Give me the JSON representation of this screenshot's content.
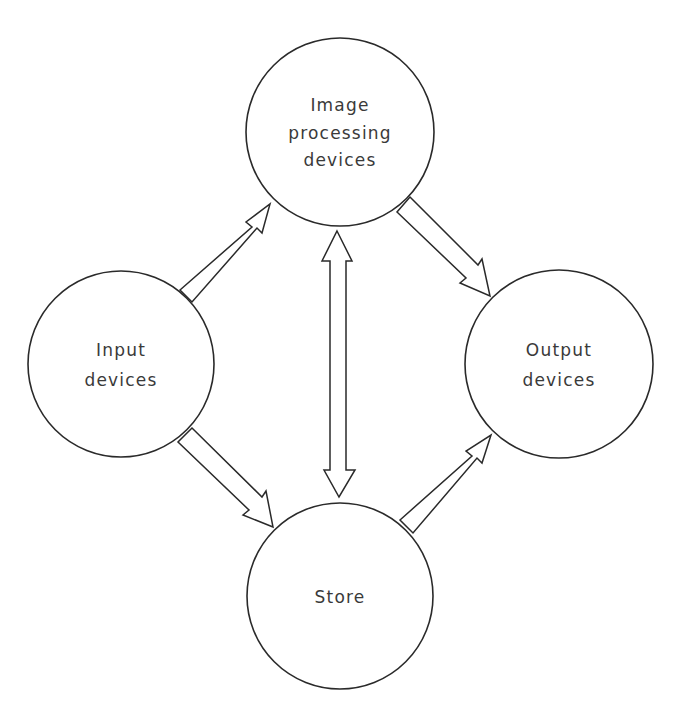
{
  "diagram": {
    "nodes": {
      "image_processing": {
        "line1": "Image",
        "line2": "processing",
        "line3": "devices"
      },
      "input": {
        "line1": "Input",
        "line2": "devices"
      },
      "output": {
        "line1": "Output",
        "line2": "devices"
      },
      "store": {
        "line1": "Store"
      }
    },
    "edges": [
      {
        "from": "Input devices",
        "to": "Image processing devices",
        "type": "one-way"
      },
      {
        "from": "Input devices",
        "to": "Store",
        "type": "one-way"
      },
      {
        "from": "Image processing devices",
        "to": "Output devices",
        "type": "one-way"
      },
      {
        "from": "Store",
        "to": "Output devices",
        "type": "one-way"
      },
      {
        "from": "Image processing devices",
        "to": "Store",
        "type": "two-way"
      }
    ],
    "colors": {
      "stroke": "#2a2a2a",
      "text": "#3a3a3a",
      "background": "#ffffff"
    }
  }
}
